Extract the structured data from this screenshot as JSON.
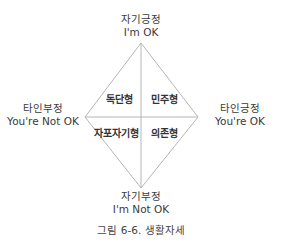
{
  "axes": {
    "top": {
      "korean": "자기긍정",
      "english": "I'm OK"
    },
    "bottom": {
      "korean": "자기부정",
      "english": "I'm Not OK"
    },
    "left": {
      "korean": "타인부정",
      "english": "You're Not OK"
    },
    "right": {
      "korean": "타인긍정",
      "english": "You're OK"
    }
  },
  "quadrants": {
    "top_left": "독단형",
    "top_right": "민주형",
    "bottom_left": "자포자기형",
    "bottom_right": "의존형"
  },
  "caption": "그림 6-6. 생활자세",
  "colors": {
    "line": "#b5b5b5",
    "text": "#333333"
  }
}
